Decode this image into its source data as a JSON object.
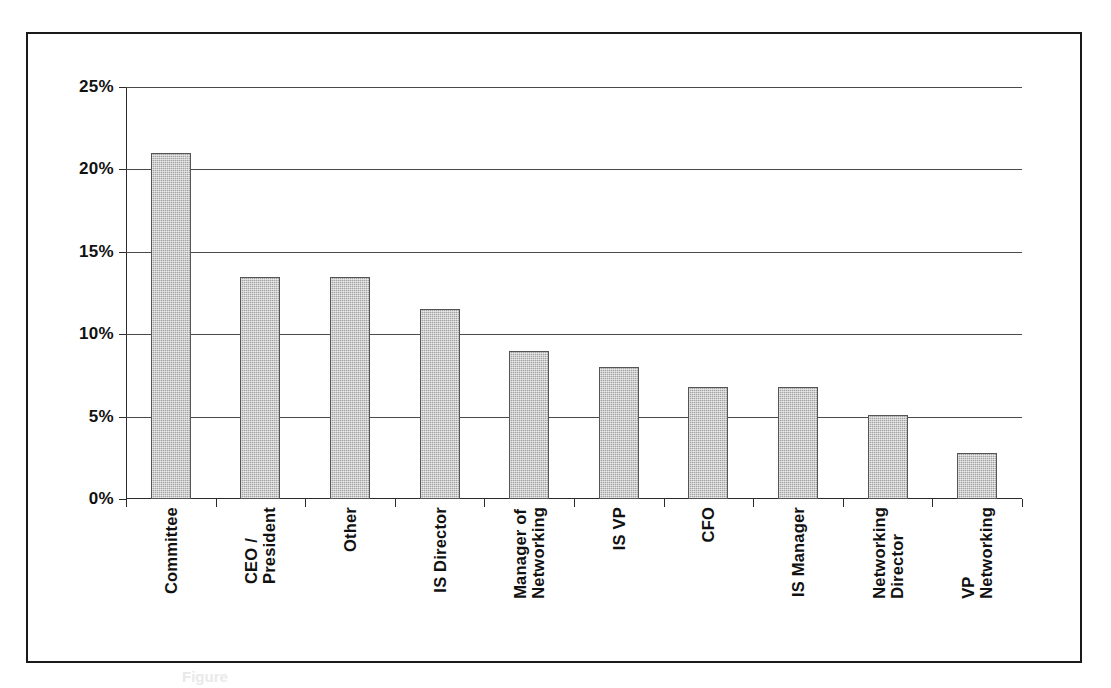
{
  "figure": {
    "caption": "Figure",
    "frame_color": "#1a1a1a",
    "bar_fill": "#a3a3a3",
    "bar_border": "#555555",
    "gridline_color": "#4a4a4a"
  },
  "chart_data": {
    "type": "bar",
    "title": "",
    "subtitle": "",
    "xlabel": "",
    "ylabel": "",
    "ylim": [
      0,
      25
    ],
    "ytick_values": [
      25,
      20,
      15,
      10,
      5,
      0
    ],
    "ytick_labels": [
      "25%",
      "20%",
      "15%",
      "10%",
      "5%",
      "0%"
    ],
    "grid": true,
    "legend": false,
    "legend_position": "none",
    "orientation": "vertical",
    "value_unit": "percent",
    "categories": [
      "Committee",
      "CEO / President",
      "Other",
      "IS Director",
      "Manager of Networking",
      "IS VP",
      "CFO",
      "IS Manager",
      "Networking Director",
      "VP Networking"
    ],
    "category_label_lines": [
      [
        "Committee"
      ],
      [
        "CEO /",
        "President"
      ],
      [
        "Other"
      ],
      [
        "IS Director"
      ],
      [
        "Manager of",
        "Networking"
      ],
      [
        "IS VP"
      ],
      [
        "CFO"
      ],
      [
        "IS Manager"
      ],
      [
        "Networking",
        "Director"
      ],
      [
        "VP",
        "Networking"
      ]
    ],
    "values": [
      21.0,
      13.5,
      13.5,
      11.5,
      9.0,
      8.0,
      6.8,
      6.8,
      5.1,
      2.8
    ]
  }
}
